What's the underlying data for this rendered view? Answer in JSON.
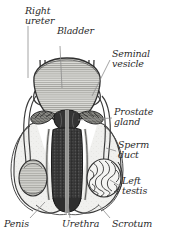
{
  "figure": {
    "background_color": "#ffffff",
    "label_color": "#2b2b2b",
    "leader_color": "#8d8d8d",
    "outline_color": "#2f2f2f"
  },
  "labels": [
    {
      "id": "right-ureter",
      "line1": "Right",
      "line2": "ureter",
      "x": 25,
      "y": 14,
      "anchor": "start"
    },
    {
      "id": "bladder",
      "line1": "Bladder",
      "line2": "",
      "x": 57,
      "y": 34,
      "anchor": "start"
    },
    {
      "id": "seminal-vesicle",
      "line1": "Seminal",
      "line2": "vesicle",
      "x": 112,
      "y": 57,
      "anchor": "start"
    },
    {
      "id": "prostate-gland",
      "line1": "Prostate",
      "line2": "gland",
      "x": 114,
      "y": 115,
      "anchor": "start"
    },
    {
      "id": "sperm-duct",
      "line1": "Sperm",
      "line2": "duct",
      "x": 118,
      "y": 148,
      "anchor": "start"
    },
    {
      "id": "left-testis",
      "line1": "Left",
      "line2": "testis",
      "x": 122,
      "y": 184,
      "anchor": "start"
    },
    {
      "id": "penis",
      "line1": "Penis",
      "line2": "",
      "x": 4,
      "y": 225,
      "anchor": "start"
    },
    {
      "id": "urethra",
      "line1": "Urethra",
      "line2": "",
      "x": 62,
      "y": 225,
      "anchor": "start"
    },
    {
      "id": "scrotum",
      "line1": "Scrotum",
      "line2": "",
      "x": 112,
      "y": 225,
      "anchor": "start"
    }
  ],
  "structures": [
    {
      "id": "bladder",
      "name": "Bladder",
      "fill": "#d8d8d4"
    },
    {
      "id": "prostate-gland",
      "name": "Prostate gland",
      "fill": "#3a3a3a"
    },
    {
      "id": "seminal-vesicle",
      "name": "Seminal vesicle",
      "fill": "#6f6f6f"
    },
    {
      "id": "penis-shaft",
      "name": "Penis",
      "fill": "#3c3c3c"
    },
    {
      "id": "urethra",
      "name": "Urethra",
      "fill": "#e9e9e6"
    },
    {
      "id": "right-testis",
      "name": "Right testis",
      "fill": "#cfcfca"
    },
    {
      "id": "left-testis",
      "name": "Left testis",
      "fill": "#efefec"
    },
    {
      "id": "scrotum",
      "name": "Scrotum",
      "fill": "#f2f2f0"
    },
    {
      "id": "right-ureter",
      "name": "Right ureter",
      "fill": "none"
    },
    {
      "id": "sperm-duct",
      "name": "Sperm duct",
      "fill": "none"
    }
  ]
}
